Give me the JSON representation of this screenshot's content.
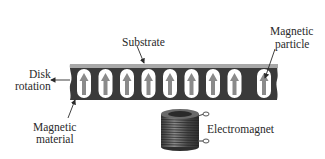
{
  "diagram": {
    "labels": {
      "substrate": "Substrate",
      "magnetic_particle_line1": "Magnetic",
      "magnetic_particle_line2": "particle",
      "disk_rotation_line1": "Disk",
      "disk_rotation_line2": "rotation",
      "magnetic_material_line1": "Magnetic",
      "magnetic_material_line2": "material",
      "electromagnet": "Electromagnet"
    },
    "particles": {
      "count": 9,
      "orientation": "up"
    },
    "colors": {
      "strip": "#3a3a3a",
      "substrate": "#a8a8a8",
      "particle_fill": "#ffffff",
      "arrow": "#8a8a8a",
      "coil": "#555555"
    }
  }
}
